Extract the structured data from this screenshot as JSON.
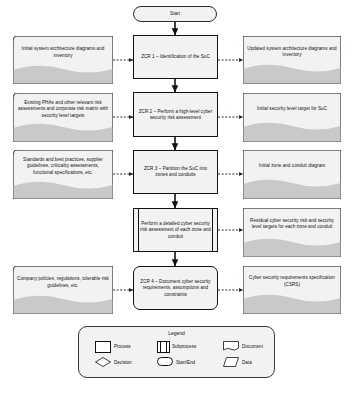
{
  "diagram": {
    "start_label": "Start",
    "processes": [
      {
        "id": "zcr1",
        "label": "ZCR 1 – Identification of the SuC",
        "type": "process"
      },
      {
        "id": "zcr2",
        "label": "ZCR 2 – Perform a high-level cyber security risk assessment",
        "type": "process"
      },
      {
        "id": "zcr3",
        "label": "ZCR 3 – Partition the SuC into zones and conduits",
        "type": "process"
      },
      {
        "id": "detailed",
        "label": "Perform a detailed cyber security risk assessment of each zone and conduit",
        "type": "subprocess"
      },
      {
        "id": "zcr4",
        "label": "ZCR 4 – Document cyber security requirements, assumptions and constraints",
        "type": "process"
      }
    ],
    "inputs": [
      {
        "id": "in1",
        "label": "Initial system architecture diagrams and inventory",
        "type": "data"
      },
      {
        "id": "in2",
        "label": "Existing PHAs and other relevant risk assessments and corporate risk matrix with security level targets",
        "type": "data"
      },
      {
        "id": "in3",
        "label": "Standards and best practices, supplier guidelines, criticality assessments, functional specifications, etc.",
        "type": "data"
      },
      {
        "id": "in4",
        "label": "Company policies, regulations, tolerable risk guidelines, etc.",
        "type": "data"
      }
    ],
    "outputs": [
      {
        "id": "out1",
        "label": "Updated system architecture diagrams and inventory",
        "type": "document"
      },
      {
        "id": "out2",
        "label": "Initial security level target for SuC",
        "type": "document"
      },
      {
        "id": "out3",
        "label": "Initial zone and conduit diagram",
        "type": "document"
      },
      {
        "id": "out4",
        "label": "Residual cyber security risk and security level targets for each zone and conduit",
        "type": "document"
      },
      {
        "id": "out5",
        "label": "Cyber security requirements specification (CSRS)",
        "type": "document"
      }
    ]
  },
  "legend": {
    "title": "Legend",
    "items": [
      {
        "key": "process",
        "label": "Process"
      },
      {
        "key": "subprocess",
        "label": "Subprocess"
      },
      {
        "key": "document",
        "label": "Document"
      },
      {
        "key": "decision",
        "label": "Decision"
      },
      {
        "key": "startend",
        "label": "Start/End"
      },
      {
        "key": "data",
        "label": "Data"
      }
    ]
  },
  "colors": {
    "shape_fill": "#f2f2f2",
    "shape_stroke": "#111111",
    "wave_fill": "#c9c9c9",
    "page_bg": "#ffffff"
  }
}
